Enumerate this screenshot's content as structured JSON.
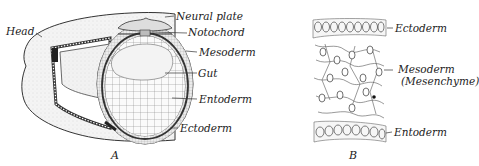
{
  "figure_a": {
    "caption": "A",
    "labels": {
      "head": "Head",
      "neural_plate": "Neural plate",
      "notochord": "Notochord",
      "mesoderm": "Mesoderm",
      "gut": "Gut",
      "entoderm": "Entoderm",
      "ectoderm": "Ectoderm"
    }
  },
  "figure_b": {
    "caption": "B",
    "labels": {
      "ectoderm": "Ectoderm",
      "mesoderm": "Mesoderm",
      "mesenchyme": "(Mesenchyme)",
      "entoderm": "Entoderm"
    }
  }
}
